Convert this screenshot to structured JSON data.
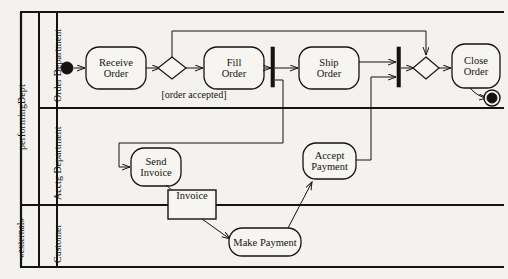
{
  "diagram": {
    "type": "uml-activity-diagram-with-swimlanes",
    "partition_header": {
      "performing_dept": "performingDept",
      "external": "«external»"
    },
    "swimlanes": [
      {
        "id": "order-department",
        "label": "Order Department"
      },
      {
        "id": "acctg-department",
        "label": "Acctg Department"
      },
      {
        "id": "customer",
        "label": "Customer"
      }
    ],
    "nodes": [
      {
        "id": "initial",
        "kind": "initial-node",
        "label": "",
        "lane": "order-department"
      },
      {
        "id": "receive-order",
        "kind": "action",
        "label_lines": [
          "Receive",
          "Order"
        ],
        "lane": "order-department"
      },
      {
        "id": "decision-1",
        "kind": "decision",
        "label": "",
        "lane": "order-department"
      },
      {
        "id": "fill-order",
        "kind": "action",
        "label_lines": [
          "Fill",
          "Order"
        ],
        "lane": "order-department"
      },
      {
        "id": "fork-1",
        "kind": "fork-bar",
        "label": "",
        "lane": "order-department"
      },
      {
        "id": "ship-order",
        "kind": "action",
        "label_lines": [
          "Ship",
          "Order"
        ],
        "lane": "order-department"
      },
      {
        "id": "join-1",
        "kind": "join-bar",
        "label": "",
        "lane": "order-department"
      },
      {
        "id": "merge-1",
        "kind": "merge",
        "label": "",
        "lane": "order-department"
      },
      {
        "id": "close-order",
        "kind": "action",
        "label_lines": [
          "Close",
          "Order"
        ],
        "lane": "order-department"
      },
      {
        "id": "final",
        "kind": "final-node",
        "label": "",
        "lane": "order-department"
      },
      {
        "id": "send-invoice",
        "kind": "action",
        "label_lines": [
          "Send",
          "Invoice"
        ],
        "lane": "acctg-department"
      },
      {
        "id": "accept-payment",
        "kind": "action",
        "label_lines": [
          "Accept",
          "Payment"
        ],
        "lane": "acctg-department"
      },
      {
        "id": "invoice-object",
        "kind": "object-node",
        "label_lines": [
          "Invoice"
        ],
        "lane": "acctg-department"
      },
      {
        "id": "make-payment",
        "kind": "action",
        "label_lines": [
          "Make Payment"
        ],
        "lane": "customer"
      }
    ],
    "edge_labels": [
      {
        "id": "order-accepted",
        "text": "[order accepted]"
      }
    ],
    "colors": {
      "background": "#f3f2ee",
      "stroke": "#15130f",
      "node_fill": "#f6f5f1",
      "text": "#15130f"
    }
  }
}
